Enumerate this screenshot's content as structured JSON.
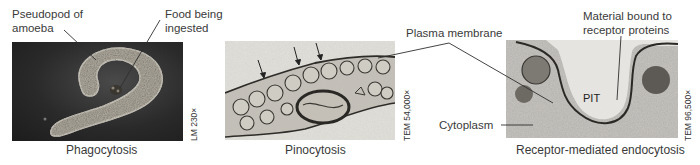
{
  "figure": {
    "panels": [
      {
        "id": "phagocytosis",
        "caption": "Phagocytosis",
        "magnification": "LM 230×",
        "labels": [
          {
            "line1": "Pseudopod of",
            "line2": "amoeba"
          },
          {
            "line1": "Food being",
            "line2": "ingested"
          }
        ]
      },
      {
        "id": "pinocytosis",
        "caption": "Pinocytosis",
        "magnification": "TEM 54,000×"
      },
      {
        "id": "receptor-mediated",
        "caption": "Receptor-mediated endocytosis",
        "magnification": "TEM 96,500×",
        "labels": [
          {
            "line1": "Material bound to",
            "line2": "receptor proteins"
          },
          {
            "text": "PIT"
          }
        ]
      }
    ],
    "shared_labels": {
      "plasma_membrane": "Plasma membrane",
      "cytoplasm": "Cytoplasm"
    }
  }
}
